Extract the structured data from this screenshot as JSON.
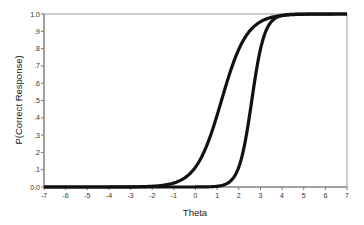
{
  "chart_data": {
    "type": "line",
    "title": "",
    "xlabel": "Theta",
    "ylabel": "P(Correct Response)",
    "xlim": [
      -7,
      7
    ],
    "ylim": [
      0,
      1
    ],
    "x_ticks": [
      "-7",
      "-6",
      "-5",
      "-4",
      "-3",
      "-2",
      "-1",
      "0",
      "1",
      "2",
      "3",
      "4",
      "5",
      "6",
      "7"
    ],
    "y_ticks": [
      "0.0",
      ".1",
      ".2",
      ".3",
      ".4",
      ".5",
      ".6",
      ".7",
      ".8",
      ".9",
      "1.0"
    ],
    "grid": false,
    "legend": null,
    "series": [
      {
        "name": "Item 1 (flatter ICC)",
        "model": "logistic",
        "difficulty_b": 1.2,
        "discrimination_a": 1.0,
        "x": [
          -7,
          -6,
          -5,
          -4,
          -3,
          -2,
          -1,
          0,
          1,
          2,
          3,
          4,
          5,
          6,
          7
        ],
        "values": [
          0.0,
          0.0,
          0.0,
          0.001,
          0.001,
          0.004,
          0.023,
          0.115,
          0.416,
          0.796,
          0.955,
          0.991,
          0.998,
          1.0,
          1.0
        ]
      },
      {
        "name": "Item 2 (steeper ICC)",
        "model": "logistic",
        "difficulty_b": 2.6,
        "discrimination_a": 2.0,
        "x": [
          -7,
          -6,
          -5,
          -4,
          -3,
          -2,
          -1,
          0,
          1,
          2,
          3,
          4,
          5,
          6,
          7
        ],
        "values": [
          0.0,
          0.0,
          0.0,
          0.0,
          0.0,
          0.0,
          0.0,
          0.0,
          0.004,
          0.116,
          0.801,
          0.992,
          1.0,
          1.0,
          1.0
        ]
      }
    ],
    "line_color": "#111111"
  }
}
